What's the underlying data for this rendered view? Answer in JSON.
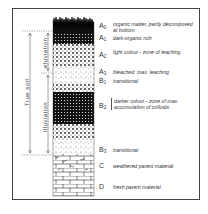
{
  "diagram": {
    "type": "soil-profile",
    "horizons": [
      {
        "code": "A",
        "sub": "0",
        "description": "organic matter, partly decomposed at bottom",
        "y": 21
      },
      {
        "code": "A",
        "sub": "1",
        "description": "dark-organic rich",
        "y": 34
      },
      {
        "code": "A",
        "sub": "2",
        "description": "light colour - zone of leaching",
        "y": 50
      },
      {
        "code": "A",
        "sub": "3",
        "description": "bleached: max. leaching",
        "y": 68
      },
      {
        "code": "B",
        "sub": "1",
        "description": "transitional",
        "y": 77
      },
      {
        "code": "B",
        "sub": "2",
        "description": "darker colour - zone of max. accumulation of colloids",
        "y": 100
      },
      {
        "code": "B",
        "sub": "3",
        "description": "transitional",
        "y": 145
      },
      {
        "code": "C",
        "sub": "",
        "description": "weathered parent material",
        "y": 161
      },
      {
        "code": "D",
        "sub": "",
        "description": "fresh parent material",
        "y": 182
      }
    ],
    "brackets": {
      "true_soil": "True soil",
      "eluviation": "eluviation",
      "illuviation": "illuviation"
    },
    "colors": {
      "ink": "#222222",
      "frame": "#444444",
      "background": "#ffffff"
    }
  }
}
